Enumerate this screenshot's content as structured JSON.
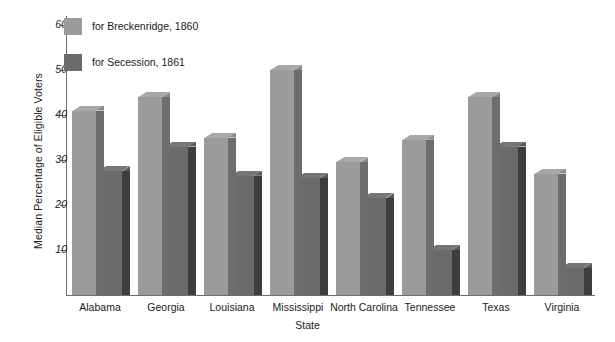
{
  "chart_data": {
    "type": "bar",
    "title": "",
    "xlabel": "State",
    "ylabel": "Median Percentage of Eligible Voters",
    "ylim": [
      0,
      62
    ],
    "yticks": [
      10,
      20,
      30,
      40,
      50,
      60
    ],
    "grid": false,
    "legend_position": "top-left",
    "categories": [
      "Alabama",
      "Georgia",
      "Louisiana",
      "Mississippi",
      "North Carolina",
      "Tennessee",
      "Texas",
      "Virginia"
    ],
    "series": [
      {
        "name": "for Breckenridge, 1860",
        "color": "#9b9b9b",
        "values": [
          41,
          44,
          35,
          50,
          29.5,
          34.5,
          44,
          27
        ]
      },
      {
        "name": "for Secession, 1861",
        "color": "#6b6b6b",
        "values": [
          27.5,
          33,
          26.5,
          26,
          21.5,
          10,
          33,
          6
        ]
      }
    ]
  },
  "axis": {
    "y_title": "Median Percentage of Eligible Voters",
    "x_title": "State",
    "tick_labels": [
      "60",
      "50",
      "40",
      "30",
      "20",
      "10"
    ]
  },
  "legend": {
    "items": [
      {
        "label": "for Breckenridge, 1860",
        "swatch": "light-gray-swatch"
      },
      {
        "label": "for Secession, 1861",
        "swatch": "dark-gray-swatch"
      }
    ]
  }
}
